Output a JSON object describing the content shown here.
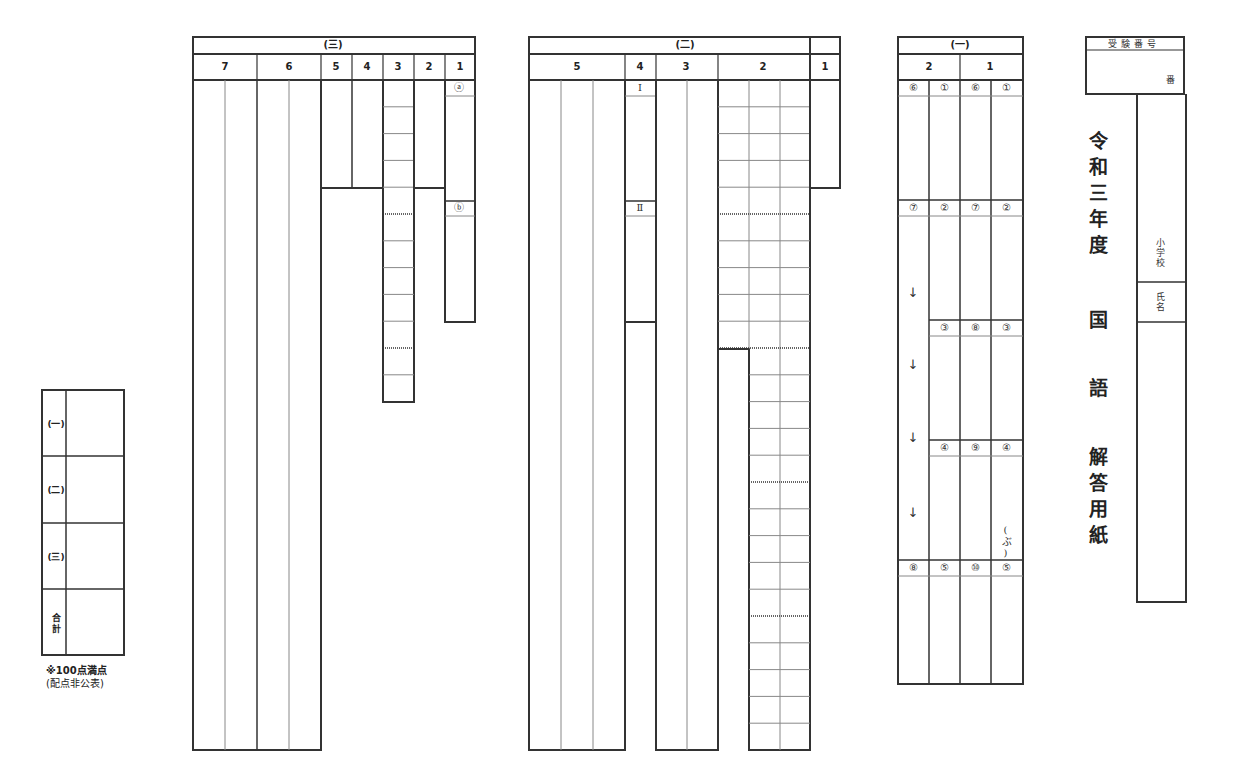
{
  "document": {
    "type": "answer-sheet",
    "title_chars": [
      "令",
      "和",
      "三",
      "年",
      "度",
      "国",
      "語",
      "解",
      "答",
      "用",
      "紙"
    ],
    "title_text": "令和三年度 国語 解答用紙"
  },
  "exam_number": {
    "header": "受験番号",
    "suffix": "番"
  },
  "identity": {
    "school_label": "小学校",
    "name_label": "氏名"
  },
  "section_1": {
    "title": "(一)",
    "questions": [
      {
        "number": "2",
        "sub_labels": [
          "⑥",
          "⑦",
          "⑧"
        ]
      },
      {
        "number": "1",
        "sub_labels": [
          "①",
          "②",
          "③",
          "④",
          "⑤",
          "⑥",
          "⑦",
          "⑧",
          "⑨",
          "⑩"
        ]
      }
    ],
    "col_labels": [
      [
        "⑥",
        "⑦",
        "⑧"
      ],
      [
        "①",
        "②",
        "③",
        "④",
        "⑤"
      ],
      [
        "⑥",
        "⑦",
        "⑧",
        "⑨",
        "⑩"
      ],
      [
        "①",
        "②",
        "③",
        "④",
        "⑤"
      ]
    ],
    "arrows": [
      "↓",
      "↓",
      "↓",
      "↓"
    ],
    "reading_hint": "(ぶ)"
  },
  "section_2": {
    "title": "(二)",
    "questions": [
      "5",
      "4",
      "3",
      "2",
      "1"
    ],
    "q4_labels": [
      "Ⅰ",
      "Ⅱ"
    ]
  },
  "section_3": {
    "title": "(三)",
    "questions": [
      "7",
      "6",
      "5",
      "4",
      "3",
      "2",
      "1"
    ],
    "q1_labels": [
      "ⓐ",
      "ⓑ"
    ]
  },
  "score_table": {
    "rows": [
      "(一)",
      "(二)",
      "(三)",
      "合計"
    ]
  },
  "notes": {
    "full_score": "※100点満点",
    "allocation": "(配点非公表)"
  }
}
